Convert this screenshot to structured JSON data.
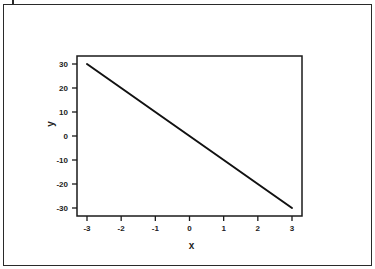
{
  "chart_data": {
    "type": "line",
    "title": "",
    "xlabel": "x",
    "ylabel": "y",
    "xlim": [
      -3,
      3
    ],
    "ylim": [
      -30,
      30
    ],
    "x_ticks": [
      -3,
      -2,
      -1,
      0,
      1,
      2,
      3
    ],
    "y_ticks": [
      30,
      20,
      10,
      0,
      -10,
      -20,
      -30
    ],
    "x_tick_labels": [
      "-3",
      "-2",
      "-1",
      "0",
      "1",
      "2",
      "3"
    ],
    "y_tick_labels": [
      "30",
      "20",
      "10",
      "0",
      "-10",
      "-20",
      "-30"
    ],
    "grid": false,
    "legend": null,
    "series": [
      {
        "name": "y = -10x",
        "x": [
          -3,
          -2,
          -1,
          0,
          1,
          2,
          3
        ],
        "values": [
          30,
          20,
          10,
          0,
          -10,
          -20,
          -30
        ],
        "color": "#111111"
      }
    ]
  },
  "layout": {
    "plot_box": {
      "left": 77,
      "top": 56,
      "right": 302,
      "bottom": 216
    },
    "x_pixel": {
      "min_val": -3,
      "max_val": 3,
      "min_px": 87,
      "max_px": 292
    },
    "y_pixel": {
      "min_val": -30,
      "max_val": 30,
      "min_px": 208,
      "max_px": 64
    }
  }
}
